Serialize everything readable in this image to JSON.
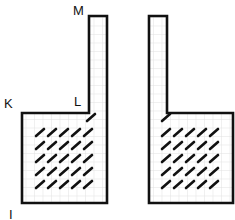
{
  "diagram": {
    "labels": {
      "M": "M",
      "K": "K",
      "L": "L",
      "I": "I"
    },
    "colors": {
      "outline": "#111111",
      "grid": "#dcdcdc",
      "hatch": "#111111",
      "background": "#ffffff"
    },
    "shapes": [
      {
        "name": "left-vessel",
        "tube": {
          "x": 89,
          "y": 16,
          "w": 18
        },
        "base": {
          "x": 22,
          "y": 113,
          "right": 107,
          "bottom": 203
        },
        "tube_side": "right",
        "hatch_rows": 5,
        "hatch_cols": 5
      },
      {
        "name": "right-vessel",
        "tube": {
          "x": 149,
          "y": 16,
          "w": 18
        },
        "base": {
          "x": 149,
          "y": 113,
          "right": 233,
          "bottom": 203
        },
        "tube_side": "left",
        "hatch_rows": 5,
        "hatch_cols": 5
      }
    ]
  }
}
